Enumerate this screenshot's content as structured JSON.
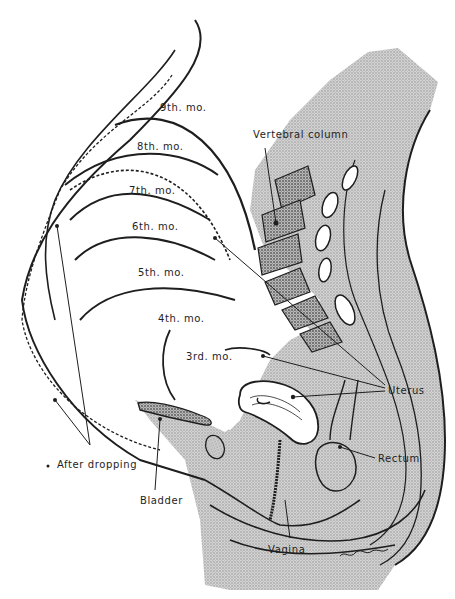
{
  "figure": {
    "colors": {
      "ink": "#1e1e1e",
      "stipple": "#bdbdbd",
      "stipple_dark": "#9a9a9a",
      "paper": "#ffffff"
    }
  },
  "month_labels": [
    {
      "id": "m9",
      "text": "9th. mo."
    },
    {
      "id": "m8",
      "text": "8th. mo."
    },
    {
      "id": "m7",
      "text": "7th. mo."
    },
    {
      "id": "m6",
      "text": "6th. mo."
    },
    {
      "id": "m5",
      "text": "5th. mo."
    },
    {
      "id": "m4",
      "text": "4th. mo."
    },
    {
      "id": "m3",
      "text": "3rd. mo."
    }
  ],
  "anatomy_labels": {
    "vertebral_column": "Vertebral column",
    "uterus": "Uterus",
    "rectum": "Rectum",
    "bladder": "Bladder",
    "vagina": "Vagina",
    "after_dropping": "After dropping"
  }
}
